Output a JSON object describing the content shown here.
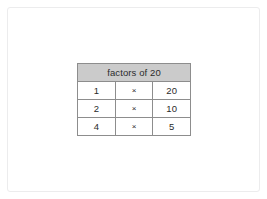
{
  "page": {
    "background_color": "#ffffff",
    "frame_color": "#ececed"
  },
  "table": {
    "title": "factors of 20",
    "header_background": "#cbcbcb",
    "border_color": "#8d8d8d",
    "operator_symbol": "×",
    "columns": [
      "factor",
      "operator",
      "factor"
    ],
    "rows": [
      {
        "left": "1",
        "op": "×",
        "right": "20"
      },
      {
        "left": "2",
        "op": "×",
        "right": "10"
      },
      {
        "left": "4",
        "op": "×",
        "right": "5"
      }
    ]
  }
}
